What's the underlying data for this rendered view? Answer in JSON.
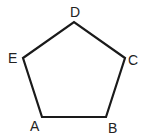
{
  "diagram": {
    "shape": "pentagon",
    "stroke_color": "#1a1a1a",
    "fill_color": "#ffffff",
    "vertices": [
      {
        "label": "A",
        "x": 42,
        "y": 117,
        "label_x": 30,
        "label_y": 131
      },
      {
        "label": "B",
        "x": 106,
        "y": 117,
        "label_x": 108,
        "label_y": 133
      },
      {
        "label": "C",
        "x": 125,
        "y": 58,
        "label_x": 128,
        "label_y": 65
      },
      {
        "label": "D",
        "x": 74,
        "y": 22,
        "label_x": 70,
        "label_y": 17
      },
      {
        "label": "E",
        "x": 23,
        "y": 58,
        "label_x": 8,
        "label_y": 63
      }
    ]
  }
}
